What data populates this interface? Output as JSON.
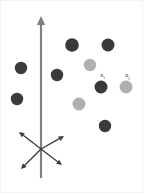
{
  "figure": {
    "name": "scatter-points-with-axis-and-direction-arrows",
    "width": 144,
    "height": 194,
    "background": "#ffffff",
    "border_color": "#f2f2f2"
  },
  "colors": {
    "dark_point": "#3a3a3a",
    "light_point": "#b0b0b0",
    "axis": "#808080",
    "arrow": "#3a3a3a",
    "label_text": "#4a4a4a"
  },
  "axis": {
    "name": "vertical-axis",
    "x": 41,
    "y_top": 16,
    "y_bottom": 178,
    "stroke_width": 2.2,
    "arrowhead": "up",
    "color": "#808080"
  },
  "direction_arrows": {
    "origin_x": 41,
    "origin_y": 149,
    "stroke_width": 1.3,
    "color": "#3a3a3a",
    "rays": [
      {
        "name": "arrow-up-left",
        "dx": -22,
        "dy": -17
      },
      {
        "name": "arrow-up-right",
        "dx": 23,
        "dy": -13
      },
      {
        "name": "arrow-down-left",
        "dx": -20,
        "dy": 20
      },
      {
        "name": "arrow-down-right",
        "dx": 21,
        "dy": 16
      }
    ]
  },
  "points": [
    {
      "name": "point-dark-1",
      "cx": 21,
      "cy": 68,
      "r": 6.2,
      "shade": "dark"
    },
    {
      "name": "point-dark-2",
      "cx": 17,
      "cy": 99,
      "r": 6.2,
      "shade": "dark"
    },
    {
      "name": "point-dark-3",
      "cx": 57,
      "cy": 75,
      "r": 6.2,
      "shade": "dark"
    },
    {
      "name": "point-dark-4",
      "cx": 72,
      "cy": 45,
      "r": 6.8,
      "shade": "dark"
    },
    {
      "name": "point-dark-5",
      "cx": 108,
      "cy": 45,
      "r": 6.5,
      "shade": "dark"
    },
    {
      "name": "point-dark-6",
      "cx": 101,
      "cy": 87,
      "r": 6.5,
      "shade": "dark"
    },
    {
      "name": "point-dark-7",
      "cx": 105,
      "cy": 126,
      "r": 6.2,
      "shade": "dark"
    },
    {
      "name": "point-light-1",
      "cx": 90,
      "cy": 65,
      "r": 6.2,
      "shade": "light"
    },
    {
      "name": "point-light-2",
      "cx": 79,
      "cy": 104,
      "r": 6.5,
      "shade": "light"
    },
    {
      "name": "point-light-3",
      "cx": 126,
      "cy": 87,
      "r": 6.5,
      "shade": "light"
    }
  ],
  "labels": [
    {
      "name": "label-x-i",
      "text": "x",
      "subscript": "i",
      "x": 100,
      "y": 72
    },
    {
      "name": "label-x-j",
      "text": "x",
      "subscript": "j",
      "x": 125,
      "y": 72
    }
  ]
}
